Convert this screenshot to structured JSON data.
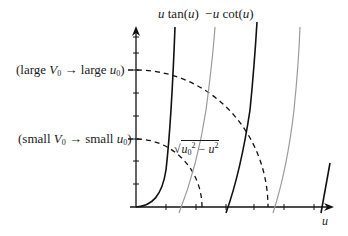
{
  "diagram": {
    "curve_labels": {
      "tan": {
        "pre": "u",
        "post": " tan(",
        "arg": "u",
        "close": ")"
      },
      "cot": {
        "pre": "−u",
        "post": " cot(",
        "arg": "u",
        "close": ")"
      }
    },
    "y_labels": {
      "large": {
        "open": "(large ",
        "V": "V",
        "sub1": "0",
        "mid": " → large ",
        "u": "u",
        "sub2": "0",
        "close": ")"
      },
      "small": {
        "open": "(small ",
        "V": "V",
        "sub1": "0",
        "mid": " → small ",
        "u": "u",
        "sub2": "0",
        "close": ")"
      }
    },
    "circle_label": {
      "u0": "u",
      "sub": "0",
      "sup1": "2",
      "minus": " − ",
      "u": "u",
      "sup2": "2"
    },
    "x_axis_label": "u",
    "colors": {
      "tan_curve": "#111111",
      "cot_curve": "#999999",
      "axis": "#111111",
      "dashed": "#111111"
    }
  }
}
